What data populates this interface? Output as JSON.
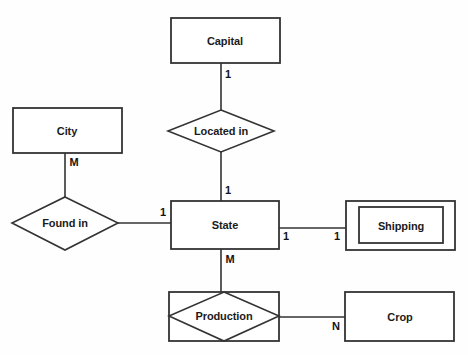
{
  "diagram": {
    "background_color": "#fefefe",
    "stroke_color": "#333333",
    "text_color": "#1b1b1b",
    "entities": [
      {
        "id": "capital",
        "label": "Capital",
        "shape": "rectangle",
        "weak": false,
        "x": 171,
        "y": 18,
        "w": 109,
        "h": 45
      },
      {
        "id": "city",
        "label": "City",
        "shape": "rectangle",
        "weak": false,
        "x": 13,
        "y": 108,
        "w": 109,
        "h": 45
      },
      {
        "id": "state",
        "label": "State",
        "shape": "rectangle",
        "weak": false,
        "x": 171,
        "y": 201,
        "w": 108,
        "h": 48
      },
      {
        "id": "shipping",
        "label": "Shipping",
        "shape": "rectangle",
        "weak": true,
        "x": 346,
        "y": 201,
        "w": 109,
        "h": 49
      },
      {
        "id": "crop",
        "label": "Crop",
        "shape": "rectangle",
        "weak": false,
        "x": 345,
        "y": 292,
        "w": 109,
        "h": 49
      }
    ],
    "relationships": [
      {
        "id": "located-in",
        "label": "Located in",
        "shape": "diamond",
        "identifying": false,
        "cx": 221,
        "cy": 131,
        "w": 106,
        "h": 43
      },
      {
        "id": "found-in",
        "label": "Found in",
        "shape": "diamond",
        "identifying": false,
        "cx": 65,
        "cy": 223,
        "w": 106,
        "h": 54
      },
      {
        "id": "production",
        "label": "Production",
        "shape": "diamond-in-rectangle",
        "identifying": true,
        "cx": 224,
        "cy": 316,
        "w": 110,
        "h": 49
      }
    ],
    "connectors": [
      {
        "id": "capital-located-in",
        "from": "capital",
        "to": "located-in",
        "points": "221,63 221,110",
        "cardinality": "1",
        "label_x": 228,
        "label_y": 74
      },
      {
        "id": "located-in-state",
        "from": "located-in",
        "to": "state",
        "points": "221,152 221,201",
        "cardinality": "1",
        "label_x": 228,
        "label_y": 190
      },
      {
        "id": "city-found-in",
        "from": "city",
        "to": "found-in",
        "points": "65,153 65,196",
        "cardinality": "M",
        "label_x": 74,
        "label_y": 162
      },
      {
        "id": "found-in-state",
        "from": "found-in",
        "to": "state",
        "points": "118,223 171,223",
        "cardinality": "1",
        "label_x": 163,
        "label_y": 212
      },
      {
        "id": "state-shipping",
        "from": "state",
        "to": "shipping",
        "points": "279,228 346,228",
        "cardinality_near": "1",
        "cardinality_far": "1",
        "label_near_x": 286,
        "label_near_y": 236,
        "label_far_x": 337,
        "label_far_y": 236
      },
      {
        "id": "state-production",
        "from": "state",
        "to": "production",
        "points": "221,249 221,292",
        "cardinality": "M",
        "label_x": 230,
        "label_y": 259
      },
      {
        "id": "production-crop",
        "from": "production",
        "to": "crop",
        "points": "279,317 345,317",
        "cardinality": "N",
        "label_x": 336,
        "label_y": 326
      }
    ]
  }
}
